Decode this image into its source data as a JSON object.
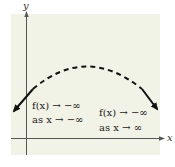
{
  "diagram": {
    "type": "function-end-behavior-graph",
    "background_color": "#f1f3e6",
    "curve_color": "#111111",
    "axis_color": "#555555",
    "axes": {
      "x_label": "x",
      "y_label": "y"
    },
    "curve": {
      "shape": "downward-opening parabola-like",
      "middle_style": "dashed",
      "ends_style": "solid with arrowheads"
    },
    "annotations": {
      "left": {
        "line1": "f(x) → −∞",
        "line2": "as x → −∞"
      },
      "right": {
        "line1": "f(x) → −∞",
        "line2": "as x → ∞"
      }
    }
  }
}
